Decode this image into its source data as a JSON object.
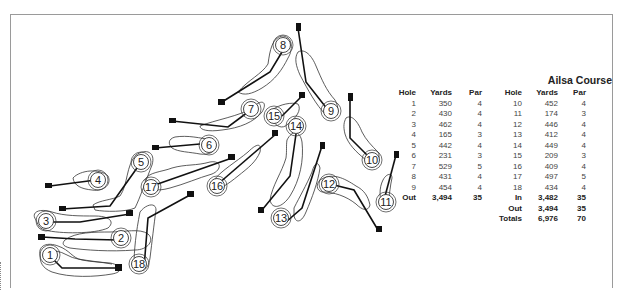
{
  "course": {
    "title": "Ailsa Course"
  },
  "scorecard": {
    "headers": [
      "Hole",
      "Yards",
      "Par",
      "Hole",
      "Yards",
      "Par"
    ],
    "front_nine": [
      {
        "hole": "1",
        "yards": "350",
        "par": "4"
      },
      {
        "hole": "2",
        "yards": "430",
        "par": "4"
      },
      {
        "hole": "3",
        "yards": "462",
        "par": "4"
      },
      {
        "hole": "4",
        "yards": "165",
        "par": "3"
      },
      {
        "hole": "5",
        "yards": "442",
        "par": "4"
      },
      {
        "hole": "6",
        "yards": "231",
        "par": "3"
      },
      {
        "hole": "7",
        "yards": "529",
        "par": "5"
      },
      {
        "hole": "8",
        "yards": "431",
        "par": "4"
      },
      {
        "hole": "9",
        "yards": "454",
        "par": "4"
      }
    ],
    "back_nine": [
      {
        "hole": "10",
        "yards": "452",
        "par": "4"
      },
      {
        "hole": "11",
        "yards": "174",
        "par": "3"
      },
      {
        "hole": "12",
        "yards": "446",
        "par": "4"
      },
      {
        "hole": "13",
        "yards": "412",
        "par": "4"
      },
      {
        "hole": "14",
        "yards": "449",
        "par": "4"
      },
      {
        "hole": "15",
        "yards": "209",
        "par": "3"
      },
      {
        "hole": "16",
        "yards": "409",
        "par": "4"
      },
      {
        "hole": "17",
        "yards": "497",
        "par": "5"
      },
      {
        "hole": "18",
        "yards": "434",
        "par": "4"
      }
    ],
    "out_front": {
      "label": "Out",
      "yards": "3,494",
      "par": "35"
    },
    "in": {
      "label": "In",
      "yards": "3,482",
      "par": "35"
    },
    "out_back": {
      "label": "Out",
      "yards": "3,494",
      "par": "35"
    },
    "totals": {
      "label": "Totals",
      "yards": "6,976",
      "par": "70"
    }
  },
  "map": {
    "hole_labels": [
      "1",
      "2",
      "3",
      "4",
      "5",
      "6",
      "7",
      "8",
      "9",
      "10",
      "11",
      "12",
      "13",
      "14",
      "15",
      "16",
      "17",
      "18"
    ]
  }
}
